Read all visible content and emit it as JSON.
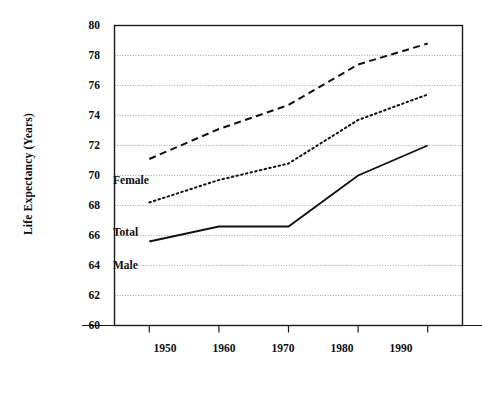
{
  "chart_data": {
    "type": "line",
    "title": "",
    "xlabel": "",
    "ylabel": "Life Expectancy (Years)",
    "x": [
      1950,
      1960,
      1970,
      1980,
      1990
    ],
    "xtick_labels": [
      "1950",
      "1960",
      "1970",
      "1980",
      "1990"
    ],
    "ytick_labels": [
      "60",
      "62",
      "64",
      "66",
      "68",
      "70",
      "72",
      "74",
      "76",
      "78",
      "80"
    ],
    "yticks": [
      60,
      62,
      64,
      66,
      68,
      70,
      72,
      74,
      76,
      78,
      80
    ],
    "ylim": [
      60,
      80
    ],
    "xlim": [
      1945,
      1995
    ],
    "grid": true,
    "grid_style": "dotted-horizontal",
    "legend_position": "inline-annotations",
    "series": [
      {
        "name": "Female",
        "label": "Female",
        "style": "dashed",
        "color": "#111111",
        "values": [
          71.1,
          73.1,
          74.7,
          77.4,
          78.8
        ]
      },
      {
        "name": "Total",
        "label": "Total",
        "style": "dotted",
        "color": "#111111",
        "values": [
          68.2,
          69.7,
          70.8,
          73.7,
          75.4
        ]
      },
      {
        "name": "Male",
        "label": "Male",
        "style": "solid",
        "color": "#111111",
        "values": [
          65.6,
          66.6,
          66.6,
          70.0,
          72.0
        ]
      }
    ],
    "annotations": [
      {
        "text": "Female",
        "x_px": 113,
        "y_px": 174
      },
      {
        "text": "Total",
        "x_px": 113,
        "y_px": 226
      },
      {
        "text": "Male",
        "x_px": 113,
        "y_px": 259
      }
    ]
  },
  "axes": {
    "frame_color": "#1a1a1a",
    "grid_color": "#9a9a9a",
    "background": "#ffffff"
  }
}
